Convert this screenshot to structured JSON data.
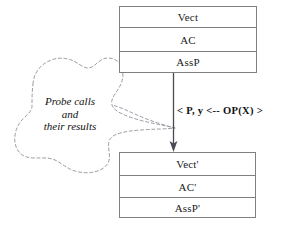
{
  "diagram": {
    "top_box": {
      "name": "abstract-state-box",
      "rows": [
        {
          "label": "Vect"
        },
        {
          "label": "AC"
        },
        {
          "label": "AssP"
        }
      ]
    },
    "bottom_box": {
      "name": "refined-state-box",
      "rows": [
        {
          "label": "Vect'"
        },
        {
          "label": "AC'"
        },
        {
          "label": "AssP'"
        }
      ]
    },
    "transition": {
      "label": "< P, y <-- OP(X) >",
      "arrow_direction": "down"
    },
    "cloud": {
      "line1": "Probe  calls",
      "line2": "and",
      "line3": "their results",
      "style": "dashed"
    },
    "colors": {
      "background": "#ffffff",
      "box_border": "#808080",
      "text": "#111111",
      "arrow": "#4a4a55",
      "cloud_stroke": "#9a9aa5"
    }
  }
}
